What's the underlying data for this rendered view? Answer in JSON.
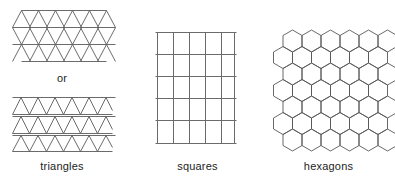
{
  "background_color": "#ffffff",
  "stroke_color": "#5a5a5a",
  "text_color": "#1c1c1c",
  "panels": [
    {
      "id": "triangles",
      "caption": "triangles",
      "connector_label": "or",
      "figures": [
        {
          "id": "triangle-grid-full",
          "shape": "triangle",
          "rows": 3,
          "cols": 5
        },
        {
          "id": "triangle-grid-bands",
          "shape": "triangle",
          "rows": 3,
          "cols": 5
        }
      ]
    },
    {
      "id": "squares",
      "caption": "squares",
      "figures": [
        {
          "id": "square-grid",
          "shape": "square",
          "rows": 5,
          "cols": 5
        }
      ]
    },
    {
      "id": "hexagons",
      "caption": "hexagons",
      "figures": [
        {
          "id": "hexagon-grid",
          "shape": "hexagon",
          "rows": 6,
          "cols": 5
        }
      ]
    }
  ],
  "geometry": {
    "triangle_side": 19.5,
    "triangle_height": 17,
    "square_size": 16,
    "hex_radius": 9.5,
    "band_gap": 2
  }
}
